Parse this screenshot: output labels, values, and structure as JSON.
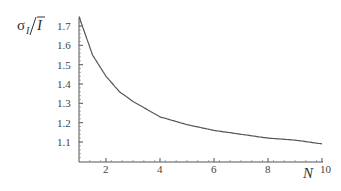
{
  "chart_data": {
    "type": "line",
    "title": "",
    "xlabel": "N",
    "ylabel": "σ_I / Ī",
    "xlim": [
      1,
      10
    ],
    "ylim": [
      1.0,
      1.76
    ],
    "grid": false,
    "legend": null,
    "x_ticks": [
      2,
      4,
      6,
      8,
      10
    ],
    "y_ticks": [
      1.1,
      1.2,
      1.3,
      1.4,
      1.5,
      1.6,
      1.7
    ],
    "x_tick_labels": [
      "2",
      "4",
      "6",
      "8",
      "10"
    ],
    "y_tick_labels": [
      "1.1",
      "1.2",
      "1.3",
      "1.4",
      "1.5",
      "1.6",
      "1.7"
    ],
    "series": [
      {
        "name": "σ_I/Ī",
        "color": "#555555",
        "x": [
          1,
          1.5,
          2,
          2.5,
          3,
          3.5,
          4,
          5,
          6,
          7,
          8,
          9,
          10
        ],
        "y": [
          1.75,
          1.55,
          1.44,
          1.36,
          1.31,
          1.27,
          1.23,
          1.19,
          1.16,
          1.14,
          1.12,
          1.11,
          1.09
        ]
      }
    ]
  },
  "labels": {
    "ylabel_sigma": "σ",
    "ylabel_sub": "I",
    "ylabel_over": "I",
    "xlabel": "N"
  }
}
